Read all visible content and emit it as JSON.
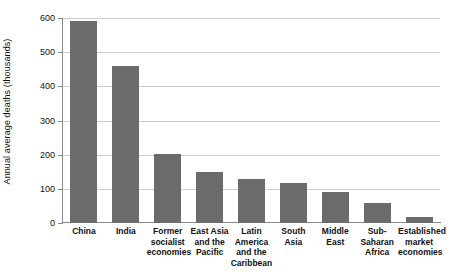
{
  "chart_data": {
    "type": "bar",
    "title": "",
    "xlabel": "",
    "ylabel": "Annual average deaths (thousands)",
    "ylim": [
      0,
      600
    ],
    "yticks": [
      0,
      100,
      200,
      300,
      400,
      500,
      600
    ],
    "ytick_labels": [
      "0",
      "100",
      "200",
      "300",
      "400",
      "500",
      "600"
    ],
    "grid": true,
    "legend": "none",
    "bar_color": "#6b6b6b",
    "gridline_color": "#cdcdcd",
    "axis_color": "#8a8a8a",
    "categories": [
      "China",
      "India",
      "Former socialist economies",
      "East Asia and the Pacific",
      "Latin America and the Caribbean",
      "South Asia",
      "Middle East",
      "Sub-Saharan Africa",
      "Established market economies"
    ],
    "category_lines": [
      [
        "China"
      ],
      [
        "India"
      ],
      [
        "Former",
        "socialist",
        "economies"
      ],
      [
        "East Asia",
        "and the",
        "Pacific"
      ],
      [
        "Latin",
        "America",
        "and the",
        "Caribbean"
      ],
      [
        "South",
        "Asia"
      ],
      [
        "Middle",
        "East"
      ],
      [
        "Sub-",
        "Saharan",
        "Africa"
      ],
      [
        "Established",
        "market",
        "economies"
      ]
    ],
    "values": [
      591,
      460,
      201,
      149,
      128,
      118,
      90,
      60,
      19
    ]
  }
}
